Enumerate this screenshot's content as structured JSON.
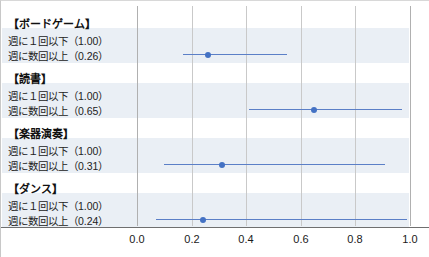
{
  "chart_data": {
    "type": "scatter",
    "title": "",
    "xlabel": "",
    "ylabel": "",
    "xlim": [
      0.0,
      1.0
    ],
    "grid": true,
    "legend": "none",
    "xticks": [
      "0.0",
      "0.2",
      "0.4",
      "0.6",
      "0.8",
      "1.0"
    ],
    "xtick_values": [
      0.0,
      0.2,
      0.4,
      0.6,
      0.8,
      1.0
    ],
    "reference_label": "週に1回以下",
    "comparison_label": "週に数回以上",
    "groups": [
      {
        "header": "【ボードゲーム】",
        "rows": [
          {
            "label": "週に１回以下（1.00）",
            "value": 1.0,
            "reference": true
          },
          {
            "label": "週に数回以上（0.26）",
            "value": 0.26,
            "ci_low": 0.17,
            "ci_high": 0.55,
            "reference": false
          }
        ]
      },
      {
        "header": "【読書】",
        "rows": [
          {
            "label": "週に１回以下（1.00）",
            "value": 1.0,
            "reference": true
          },
          {
            "label": "週に数回以上（0.65）",
            "value": 0.65,
            "ci_low": 0.41,
            "ci_high": 0.97,
            "reference": false
          }
        ]
      },
      {
        "header": "【楽器演奏】",
        "rows": [
          {
            "label": "週に１回以下（1.00）",
            "value": 1.0,
            "reference": true
          },
          {
            "label": "週に数回以上（0.31）",
            "value": 0.31,
            "ci_low": 0.1,
            "ci_high": 0.91,
            "reference": false
          }
        ]
      },
      {
        "header": "【ダンス】",
        "rows": [
          {
            "label": "週に１回以下（1.00）",
            "value": 1.0,
            "reference": true
          },
          {
            "label": "週に数回以上（0.24）",
            "value": 0.24,
            "ci_low": 0.07,
            "ci_high": 0.99,
            "reference": false
          }
        ]
      }
    ],
    "colors": {
      "marker": "#4472c4",
      "ci_line": "#5b7fc7",
      "band": "#eaeff5",
      "gridline": "#c9c9c9",
      "axis": "#6f6f6f"
    }
  }
}
